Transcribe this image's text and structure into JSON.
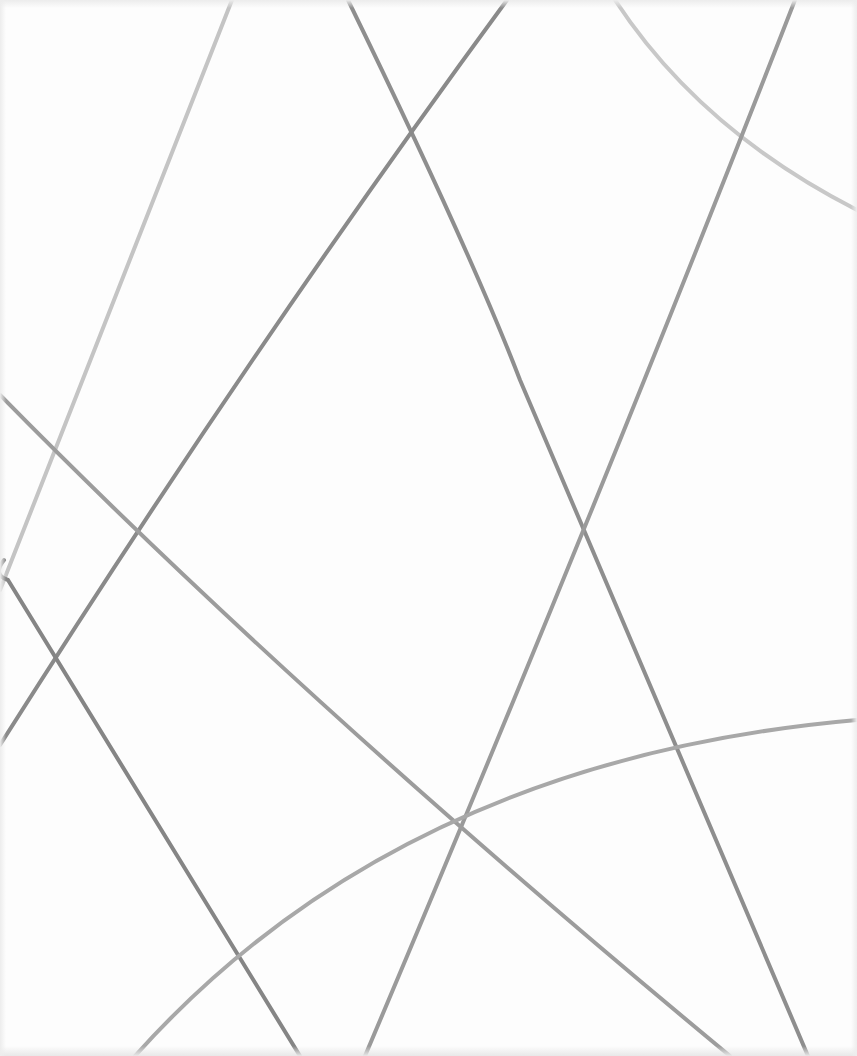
{
  "image": {
    "description": "Abstract pattern of intersecting gray lines on white background",
    "background": "#fdfdfd",
    "lines": [
      {
        "id": "l1",
        "d": "M 232 0 L 0 590",
        "color": "#c4c4c4",
        "width": 4
      },
      {
        "id": "l2",
        "d": "M 348 0 Q 470 250 520 380 L 808 1056",
        "color": "#8e8e8e",
        "width": 4
      },
      {
        "id": "l3",
        "d": "M 507 0 Q 250 350 0 745",
        "color": "#8a8a8a",
        "width": 4
      },
      {
        "id": "l4",
        "d": "M 615 0 Q 700 130 857 210",
        "color": "#c8c8c8",
        "width": 4
      },
      {
        "id": "l5",
        "d": "M 795 0 Q 600 500 365 1056",
        "color": "#9a9a9a",
        "width": 4
      },
      {
        "id": "l6",
        "d": "M 0 395 Q 300 700 730 1056",
        "color": "#9c9c9c",
        "width": 4
      },
      {
        "id": "l7",
        "d": "M 4 560 Q -8 575 8 580 L 300 1056",
        "color": "#858585",
        "width": 4
      },
      {
        "id": "l8",
        "d": "M 135 1056 Q 400 760 857 720",
        "color": "#a8a8a8",
        "width": 4
      }
    ]
  }
}
